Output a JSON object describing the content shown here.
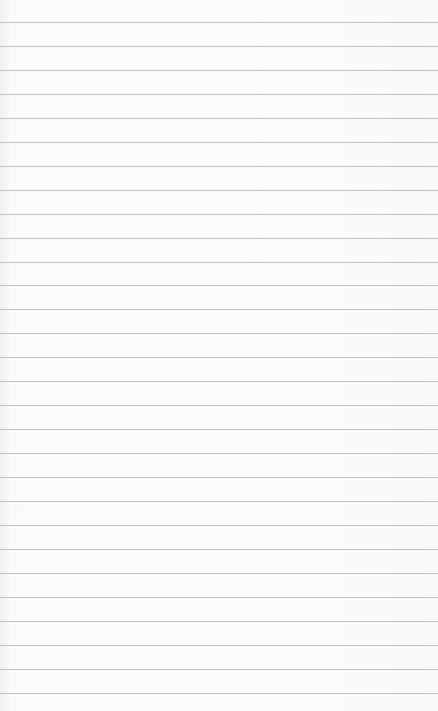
{
  "image": {
    "subject": "lined-paper",
    "description": "Blank ruled notebook paper with horizontal gray lines",
    "paper_color": "#fbfbfa",
    "line_color": "#b9b9b9",
    "line_count": 29,
    "first_line_y": 22,
    "line_spacing": 23.95
  }
}
